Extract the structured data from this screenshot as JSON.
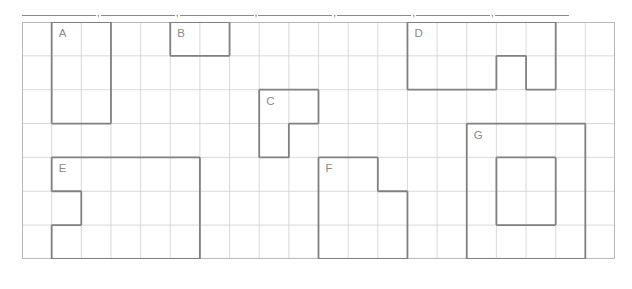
{
  "answer_row": {
    "separator": ",",
    "blanks": [
      {
        "label": "blank-1",
        "width": 74
      },
      {
        "label": "blank-2",
        "width": 74
      },
      {
        "label": "blank-3",
        "width": 74
      },
      {
        "label": "blank-4",
        "width": 74
      },
      {
        "label": "blank-5",
        "width": 74
      },
      {
        "label": "blank-6",
        "width": 74
      },
      {
        "label": "blank-7",
        "width": 74
      }
    ]
  },
  "grid": {
    "columns": 20,
    "rows": 7,
    "cell_width": 29.65,
    "cell_height": 33.85,
    "line_color": "#cfcfcf",
    "border_color": "#b8b8b8"
  },
  "shapes": [
    {
      "id": "A",
      "label": "A",
      "label_col": 1,
      "label_row": 0,
      "cells": [
        [
          1,
          0
        ],
        [
          2,
          0
        ],
        [
          1,
          1
        ],
        [
          2,
          1
        ],
        [
          1,
          2
        ],
        [
          2,
          2
        ]
      ],
      "outline_color": "#808080"
    },
    {
      "id": "B",
      "label": "B",
      "label_col": 5,
      "label_row": 0,
      "cells": [
        [
          5,
          0
        ],
        [
          6,
          0
        ]
      ],
      "outline_color": "#808080"
    },
    {
      "id": "C",
      "label": "C",
      "label_col": 8,
      "label_row": 2,
      "cells": [
        [
          8,
          2
        ],
        [
          9,
          2
        ],
        [
          8,
          3
        ]
      ],
      "outline_color": "#808080"
    },
    {
      "id": "D",
      "label": "D",
      "label_col": 13,
      "label_row": 0,
      "cells": [
        [
          13,
          0
        ],
        [
          14,
          0
        ],
        [
          15,
          0
        ],
        [
          16,
          0
        ],
        [
          17,
          0
        ],
        [
          13,
          1
        ],
        [
          14,
          1
        ],
        [
          15,
          1
        ],
        [
          17,
          1
        ]
      ],
      "outline_color": "#808080"
    },
    {
      "id": "E",
      "label": "E",
      "label_col": 1,
      "label_row": 4,
      "cells": [
        [
          1,
          4
        ],
        [
          2,
          4
        ],
        [
          3,
          4
        ],
        [
          4,
          4
        ],
        [
          5,
          4
        ],
        [
          2,
          5
        ],
        [
          3,
          5
        ],
        [
          4,
          5
        ],
        [
          5,
          5
        ],
        [
          1,
          6
        ],
        [
          2,
          6
        ],
        [
          3,
          6
        ],
        [
          4,
          6
        ],
        [
          5,
          6
        ]
      ],
      "outline_color": "#808080"
    },
    {
      "id": "F",
      "label": "F",
      "label_col": 10,
      "label_row": 4,
      "cells": [
        [
          10,
          4
        ],
        [
          11,
          4
        ],
        [
          10,
          5
        ],
        [
          11,
          5
        ],
        [
          12,
          5
        ],
        [
          10,
          6
        ],
        [
          11,
          6
        ],
        [
          12,
          6
        ]
      ],
      "outline_color": "#808080"
    },
    {
      "id": "G",
      "label": "G",
      "label_col": 15,
      "label_row": 3,
      "cells": [
        [
          15,
          3
        ],
        [
          16,
          3
        ],
        [
          17,
          3
        ],
        [
          18,
          3
        ],
        [
          15,
          4
        ],
        [
          18,
          4
        ],
        [
          15,
          5
        ],
        [
          18,
          5
        ],
        [
          15,
          6
        ],
        [
          16,
          6
        ],
        [
          17,
          6
        ],
        [
          18,
          6
        ]
      ],
      "outline_color": "#808080"
    }
  ]
}
